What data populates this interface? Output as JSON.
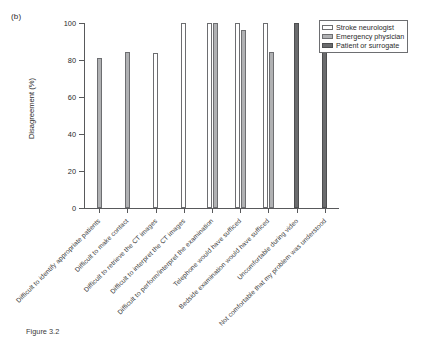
{
  "panel_label": "(b)",
  "chart_data": {
    "type": "bar",
    "title": "",
    "subtitle": "",
    "xlabel": "",
    "ylabel": "Disagreement (%)",
    "ylim": [
      0,
      100
    ],
    "yticks": [
      0,
      20,
      40,
      60,
      80,
      100
    ],
    "ytick_labels": [
      "0",
      "20",
      "40",
      "60",
      "80",
      "100"
    ],
    "grid": false,
    "legend_position": "top-right",
    "categories": [
      "Difficult to identify appropriate patients",
      "Difficult to make contact",
      "Difficult to retrieve the CT images",
      "Difficult to interpret the CT images",
      "Difficult to perform/interpret the examination",
      "Telephone would have sufficed",
      "Bedside examination would have sufficed",
      "Uncomfortable during video",
      "Not comfortable that my problem was understood"
    ],
    "series": [
      {
        "name": "Stroke neurologist",
        "color": "#ffffff",
        "values": [
          null,
          null,
          84,
          100,
          100,
          100,
          100,
          null,
          null
        ]
      },
      {
        "name": "Emergency physician",
        "color": "#b0b1b3",
        "values": [
          81,
          84.5,
          null,
          null,
          100,
          96,
          84.5,
          null,
          null
        ]
      },
      {
        "name": "Patient or surrogate",
        "color": "#6a6b6d",
        "values": [
          null,
          null,
          null,
          null,
          null,
          null,
          null,
          100,
          90
        ]
      }
    ]
  },
  "legend": {
    "items": [
      {
        "label": "Stroke neurologist"
      },
      {
        "label": "Emergency physician"
      },
      {
        "label": "Patient or surrogate"
      }
    ]
  },
  "caption": "Figure 3.2"
}
